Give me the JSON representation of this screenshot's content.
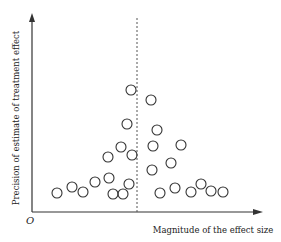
{
  "chart_data": {
    "type": "scatter",
    "title": "",
    "xlabel": "Magnitude of the effect size",
    "ylabel": "Precision of estimate of treatment effect",
    "origin_label": "O",
    "grid": false,
    "legend": null,
    "reference_line": {
      "type": "vertical",
      "style": "dashed",
      "x_px": 137,
      "meaning": "true/pooled effect size"
    },
    "axis_ticks": "none (conceptual funnel plot)",
    "points_px": [
      [
        131,
        90
      ],
      [
        151,
        100
      ],
      [
        127,
        124
      ],
      [
        157,
        130
      ],
      [
        121,
        147
      ],
      [
        153,
        146
      ],
      [
        181,
        145
      ],
      [
        108,
        157
      ],
      [
        132,
        155
      ],
      [
        171,
        163
      ],
      [
        152,
        170
      ],
      [
        109,
        178
      ],
      [
        129,
        184
      ],
      [
        57,
        193
      ],
      [
        72,
        187
      ],
      [
        83,
        192
      ],
      [
        95,
        182
      ],
      [
        113,
        194
      ],
      [
        123,
        194
      ],
      [
        160,
        193
      ],
      [
        175,
        188
      ],
      [
        191,
        192
      ],
      [
        201,
        184
      ],
      [
        211,
        191
      ],
      [
        223,
        192
      ]
    ],
    "marker": {
      "shape": "open-circle",
      "radius_px": 5,
      "stroke": "#333333"
    },
    "colors": {
      "axis": "#333333",
      "marker": "#333333",
      "dashed_line": "#555555",
      "background": "#ffffff"
    }
  }
}
